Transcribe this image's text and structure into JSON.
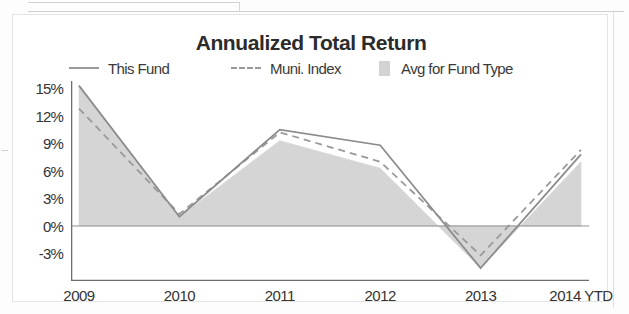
{
  "chart_data": {
    "type": "area",
    "title": "Annualized Total Return",
    "xlabel": "",
    "ylabel": "",
    "categories": [
      "2009",
      "2010",
      "2011",
      "2012",
      "2013",
      "2014 YTD"
    ],
    "ytick_labels": [
      "15%",
      "12%",
      "9%",
      "6%",
      "3%",
      "0%",
      "-3%"
    ],
    "ytick_values": [
      15,
      12,
      9,
      6,
      3,
      0,
      -3
    ],
    "ylim": [
      -6,
      15.8
    ],
    "grid": false,
    "legend_position": "top",
    "zero_line": true,
    "series": [
      {
        "name": "This Fund",
        "style": "solid-line",
        "color": "#8c8c8c",
        "values": [
          15.3,
          1.0,
          10.5,
          8.8,
          -4.6,
          7.8
        ]
      },
      {
        "name": "Muni. Index",
        "style": "dashed-line",
        "color": "#9a9a9a",
        "values": [
          12.8,
          1.3,
          10.2,
          7.0,
          -3.2,
          8.3
        ]
      },
      {
        "name": "Avg for Fund Type",
        "style": "filled-area",
        "color": "#d3d3d3",
        "values": [
          15.3,
          1.0,
          9.3,
          6.3,
          -4.6,
          7.0
        ]
      }
    ]
  },
  "legend": {
    "items": [
      {
        "label": "This Fund",
        "marker": "solid-line-swatch"
      },
      {
        "label": "Muni. Index",
        "marker": "dashed-line-swatch"
      },
      {
        "label": "Avg for Fund Type",
        "marker": "filled-box-swatch"
      }
    ]
  },
  "colors": {
    "line_this_fund": "#8c8c8c",
    "line_muni_index": "#9a9a9a",
    "area_avg_fund_type": "#d3d3d3",
    "axis": "#6e6e6e",
    "text": "#333333",
    "title": "#2b2b2b",
    "background": "#ffffff"
  }
}
